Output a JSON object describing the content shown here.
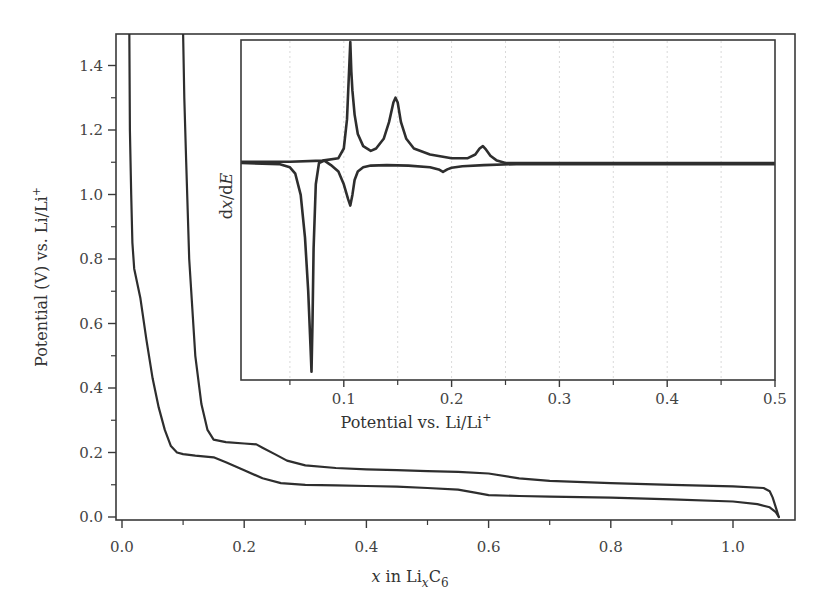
{
  "chart_data": [
    {
      "name": "main",
      "type": "line",
      "title": "",
      "xlabel": "x in LixC6",
      "xlabel_parts": {
        "var": "x",
        "mid": " in Li",
        "sub": "x",
        "tail": "C",
        "sub2": "6"
      },
      "ylabel": "Potential (V) vs. Li/Li+",
      "ylabel_parts": {
        "main": "Potential (V) vs. Li/Li",
        "sup": "+"
      },
      "xlim": [
        -0.01,
        1.1
      ],
      "ylim": [
        -0.01,
        1.5
      ],
      "xticks": [
        0.0,
        0.2,
        0.4,
        0.6,
        0.8,
        1.0
      ],
      "xtick_labels": [
        "0.0",
        "0.2",
        "0.4",
        "0.6",
        "0.8",
        "1.0"
      ],
      "xminor": [
        0.1,
        0.3,
        0.5,
        0.7,
        0.9
      ],
      "yticks": [
        0.0,
        0.2,
        0.4,
        0.6,
        0.8,
        1.0,
        1.2,
        1.4
      ],
      "ytick_labels": [
        "0.0",
        "0.2",
        "0.4",
        "0.6",
        "0.8",
        "1.0",
        "1.2",
        "1.4"
      ],
      "yminor": [
        0.1,
        0.3,
        0.5,
        0.7,
        0.9,
        1.1,
        1.3
      ],
      "grid": false,
      "series": [
        {
          "name": "discharge (lithiation)",
          "x": [
            0.012,
            0.013,
            0.015,
            0.017,
            0.02,
            0.03,
            0.04,
            0.05,
            0.06,
            0.07,
            0.08,
            0.09,
            0.1,
            0.12,
            0.15,
            0.17,
            0.2,
            0.23,
            0.26,
            0.3,
            0.35,
            0.4,
            0.45,
            0.5,
            0.55,
            0.58,
            0.6,
            0.65,
            0.7,
            0.8,
            0.9,
            1.0,
            1.04,
            1.06,
            1.07,
            1.075
          ],
          "y": [
            1.5,
            1.2,
            1.0,
            0.85,
            0.77,
            0.68,
            0.55,
            0.43,
            0.34,
            0.27,
            0.22,
            0.2,
            0.195,
            0.19,
            0.185,
            0.17,
            0.145,
            0.12,
            0.105,
            0.1,
            0.098,
            0.096,
            0.094,
            0.09,
            0.085,
            0.075,
            0.068,
            0.065,
            0.063,
            0.06,
            0.055,
            0.048,
            0.04,
            0.03,
            0.015,
            0.0
          ]
        },
        {
          "name": "charge (delithiation)",
          "x": [
            1.075,
            1.07,
            1.065,
            1.06,
            1.05,
            1.0,
            0.9,
            0.8,
            0.7,
            0.65,
            0.6,
            0.55,
            0.5,
            0.45,
            0.4,
            0.35,
            0.3,
            0.27,
            0.25,
            0.23,
            0.22,
            0.2,
            0.17,
            0.15,
            0.14,
            0.13,
            0.12,
            0.11,
            0.105,
            0.102,
            0.1
          ],
          "y": [
            0.0,
            0.03,
            0.06,
            0.08,
            0.09,
            0.095,
            0.1,
            0.105,
            0.112,
            0.12,
            0.135,
            0.14,
            0.142,
            0.145,
            0.148,
            0.152,
            0.16,
            0.175,
            0.195,
            0.215,
            0.225,
            0.228,
            0.232,
            0.24,
            0.27,
            0.35,
            0.5,
            0.8,
            1.1,
            1.3,
            1.5
          ]
        }
      ]
    },
    {
      "name": "inset",
      "type": "line",
      "title": "",
      "xlabel": "Potential vs. Li/Li+",
      "xlabel_parts": {
        "main": "Potential vs. Li/Li",
        "sup": "+"
      },
      "ylabel": "dx/dE",
      "ylabel_parts": {
        "d1": "d",
        "v1": "x",
        "slash": "/d",
        "v2": "E"
      },
      "xlim": [
        0.005,
        0.5
      ],
      "ylim": [
        -1.0,
        0.5
      ],
      "xticks": [
        0.1,
        0.2,
        0.3,
        0.4,
        0.5
      ],
      "xtick_labels": [
        "0.1",
        "0.2",
        "0.3",
        "0.4",
        "0.5"
      ],
      "xminor": [
        0.05,
        0.15,
        0.25,
        0.35,
        0.45
      ],
      "grid": true,
      "grid_style": "vertical dotted at 0.05 intervals",
      "yticks": [],
      "series": [
        {
          "name": "charge (positive peaks)",
          "x": [
            0.005,
            0.05,
            0.08,
            0.095,
            0.1,
            0.103,
            0.106,
            0.107,
            0.108,
            0.11,
            0.113,
            0.118,
            0.125,
            0.13,
            0.137,
            0.142,
            0.146,
            0.148,
            0.15,
            0.153,
            0.158,
            0.165,
            0.18,
            0.2,
            0.215,
            0.222,
            0.226,
            0.229,
            0.232,
            0.236,
            0.242,
            0.25,
            0.5
          ],
          "y": [
            0.005,
            0.005,
            0.01,
            0.02,
            0.06,
            0.18,
            0.5,
            0.38,
            0.3,
            0.2,
            0.12,
            0.07,
            0.05,
            0.06,
            0.1,
            0.17,
            0.25,
            0.27,
            0.25,
            0.17,
            0.1,
            0.06,
            0.035,
            0.02,
            0.02,
            0.035,
            0.06,
            0.07,
            0.055,
            0.03,
            0.01,
            0.0,
            0.0
          ]
        },
        {
          "name": "discharge (negative peaks)",
          "x": [
            0.005,
            0.04,
            0.05,
            0.055,
            0.06,
            0.064,
            0.067,
            0.069,
            0.07,
            0.071,
            0.072,
            0.074,
            0.077,
            0.082,
            0.088,
            0.095,
            0.1,
            0.104,
            0.106,
            0.108,
            0.11,
            0.113,
            0.118,
            0.125,
            0.14,
            0.16,
            0.18,
            0.188,
            0.192,
            0.196,
            0.2,
            0.21,
            0.23,
            0.26,
            0.5
          ],
          "y": [
            0.0,
            -0.005,
            -0.02,
            -0.05,
            -0.15,
            -0.35,
            -0.6,
            -0.85,
            -0.98,
            -0.75,
            -0.4,
            -0.1,
            0.0,
            0.01,
            -0.01,
            -0.04,
            -0.1,
            -0.17,
            -0.2,
            -0.15,
            -0.08,
            -0.04,
            -0.02,
            -0.012,
            -0.01,
            -0.012,
            -0.02,
            -0.03,
            -0.042,
            -0.03,
            -0.022,
            -0.015,
            -0.01,
            -0.005,
            -0.005
          ]
        }
      ]
    }
  ],
  "colors": {
    "line": "#2e2e2e",
    "axis": "#3a3a3a",
    "grid": "#cfcfcf",
    "text": "#444444"
  }
}
